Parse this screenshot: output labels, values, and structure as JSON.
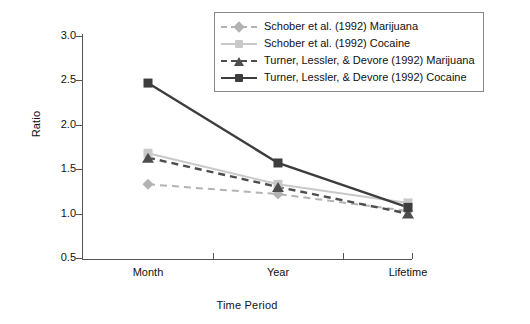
{
  "chart_data": {
    "type": "line",
    "title": "",
    "xlabel": "Time Period",
    "ylabel": "Ratio",
    "categories": [
      "Month",
      "Year",
      "Lifetime"
    ],
    "yticks": [
      "0.5",
      "1.0",
      "1.5",
      "2.0",
      "2.5",
      "3.0"
    ],
    "ylim": [
      0.5,
      3.0
    ],
    "grid": false,
    "legend_position": "top-right",
    "series": [
      {
        "name": "Schober et al. (1992) Marijuana",
        "values": [
          1.33,
          1.22,
          1.03
        ],
        "color": "#b3b3b3",
        "marker": "diamond",
        "linestyle": "dashed"
      },
      {
        "name": "Schober et al. (1992) Cocaine",
        "values": [
          1.68,
          1.33,
          1.12
        ],
        "color": "#c9c9c9",
        "marker": "square",
        "linestyle": "solid"
      },
      {
        "name": "Turner, Lessler, & Devore (1992) Marijuana",
        "values": [
          1.63,
          1.3,
          1.0
        ],
        "color": "#4d4d4d",
        "marker": "triangle",
        "linestyle": "dashed"
      },
      {
        "name": "Turner, Lessler, & Devore (1992) Cocaine",
        "values": [
          2.47,
          1.57,
          1.07
        ],
        "color": "#3d3d3d",
        "marker": "square",
        "linestyle": "solid"
      }
    ]
  }
}
